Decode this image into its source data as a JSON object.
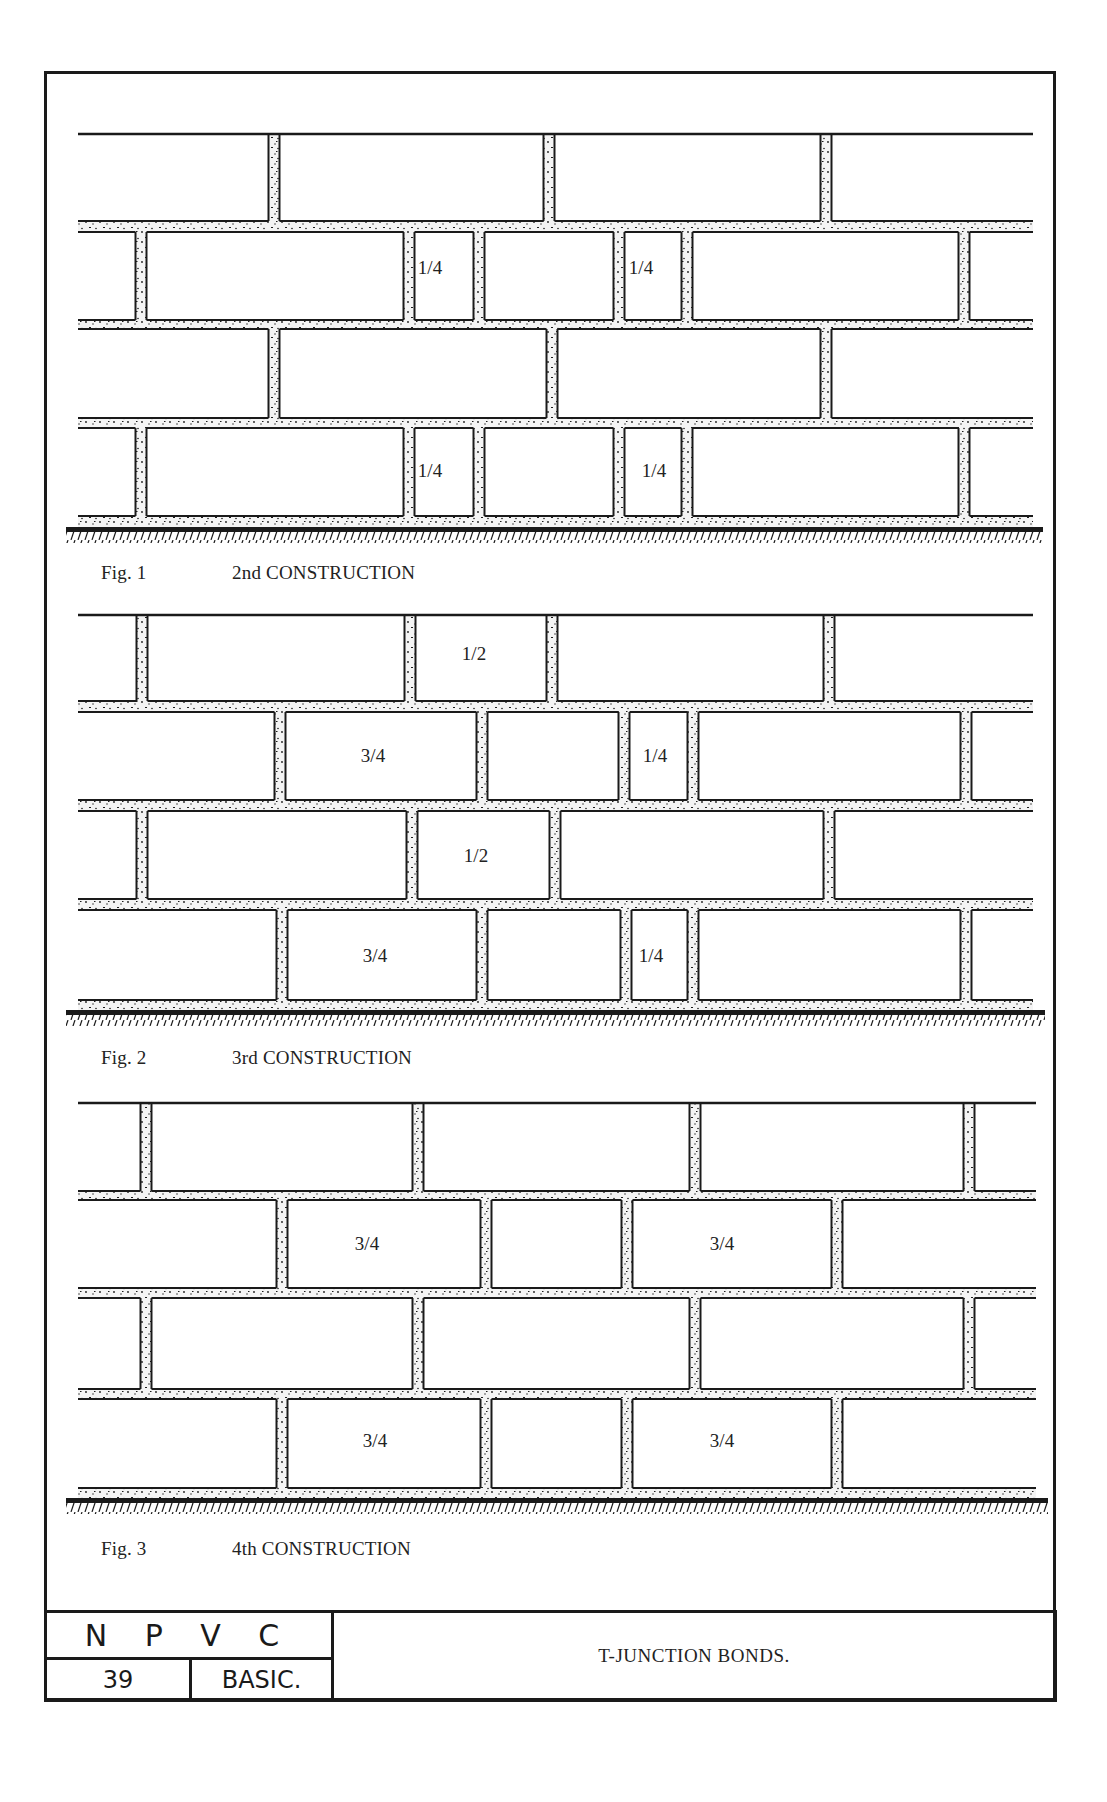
{
  "sheet": {
    "title": "T-JUNCTION BONDS.",
    "org": "N P V C",
    "sheet_number": "39",
    "level": "BASIC."
  },
  "colors": {
    "ink": "#1a1a1a",
    "paper": "#ffffff",
    "mortar": "#f4f4f4"
  },
  "figures": [
    {
      "fig_label": "Fig. 1",
      "construction": "2nd CONSTRUCTION",
      "caption_y": 562,
      "wall": {
        "x1": 78,
        "x2": 1033,
        "top": 134,
        "courses": [
          {
            "y1": 134,
            "y2": 221,
            "joints": [
              274,
              549,
              826
            ],
            "labels": []
          },
          {
            "y1": 232,
            "y2": 320,
            "joints": [
              141,
              409,
              479,
              619,
              687,
              964
            ],
            "labels": [
              {
                "text": "1/4",
                "x": 430,
                "y": 274
              },
              {
                "text": "1/4",
                "x": 641,
                "y": 274
              }
            ]
          },
          {
            "y1": 329,
            "y2": 418,
            "joints": [
              274,
              552,
              826
            ],
            "labels": []
          },
          {
            "y1": 428,
            "y2": 516,
            "joints": [
              141,
              409,
              479,
              619,
              687,
              964
            ],
            "labels": [
              {
                "text": "1/4",
                "x": 430,
                "y": 477
              },
              {
                "text": "1/4",
                "x": 654,
                "y": 477
              }
            ]
          }
        ],
        "ground_y": 527,
        "ground_x1": 66,
        "ground_x2": 1043
      }
    },
    {
      "fig_label": "Fig. 2",
      "construction": "3rd CONSTRUCTION",
      "caption_y": 1047,
      "wall": {
        "x1": 78,
        "x2": 1033,
        "top": 615,
        "courses": [
          {
            "y1": 615,
            "y2": 701,
            "joints": [
              142,
              410,
              552,
              829
            ],
            "labels": [
              {
                "text": "1/2",
                "x": 474,
                "y": 660
              }
            ]
          },
          {
            "y1": 712,
            "y2": 800,
            "joints": [
              280,
              482,
              624,
              693,
              966
            ],
            "labels": [
              {
                "text": "3/4",
                "x": 373,
                "y": 762
              },
              {
                "text": "1/4",
                "x": 655,
                "y": 762
              }
            ]
          },
          {
            "y1": 811,
            "y2": 899,
            "joints": [
              142,
              412,
              555,
              829
            ],
            "labels": [
              {
                "text": "1/2",
                "x": 476,
                "y": 862
              }
            ]
          },
          {
            "y1": 910,
            "y2": 1000,
            "joints": [
              282,
              482,
              626,
              693,
              966
            ],
            "labels": [
              {
                "text": "3/4",
                "x": 375,
                "y": 962
              },
              {
                "text": "1/4",
                "x": 651,
                "y": 962
              }
            ]
          }
        ],
        "ground_y": 1010,
        "ground_x1": 66,
        "ground_x2": 1045
      }
    },
    {
      "fig_label": "Fig. 3",
      "construction": "4th CONSTRUCTION",
      "caption_y": 1538,
      "wall": {
        "x1": 78,
        "x2": 1036,
        "top": 1103,
        "courses": [
          {
            "y1": 1103,
            "y2": 1191,
            "joints": [
              146,
              418,
              695,
              969
            ],
            "labels": []
          },
          {
            "y1": 1200,
            "y2": 1288,
            "joints": [
              282,
              486,
              627,
              837
            ],
            "labels": [
              {
                "text": "3/4",
                "x": 367,
                "y": 1250
              },
              {
                "text": "3/4",
                "x": 722,
                "y": 1250
              }
            ]
          },
          {
            "y1": 1298,
            "y2": 1389,
            "joints": [
              146,
              418,
              695,
              969
            ],
            "labels": []
          },
          {
            "y1": 1399,
            "y2": 1488,
            "joints": [
              282,
              486,
              627,
              837
            ],
            "labels": [
              {
                "text": "3/4",
                "x": 375,
                "y": 1447
              },
              {
                "text": "3/4",
                "x": 722,
                "y": 1447
              }
            ]
          }
        ],
        "ground_y": 1498,
        "ground_x1": 66,
        "ground_x2": 1048
      }
    }
  ]
}
